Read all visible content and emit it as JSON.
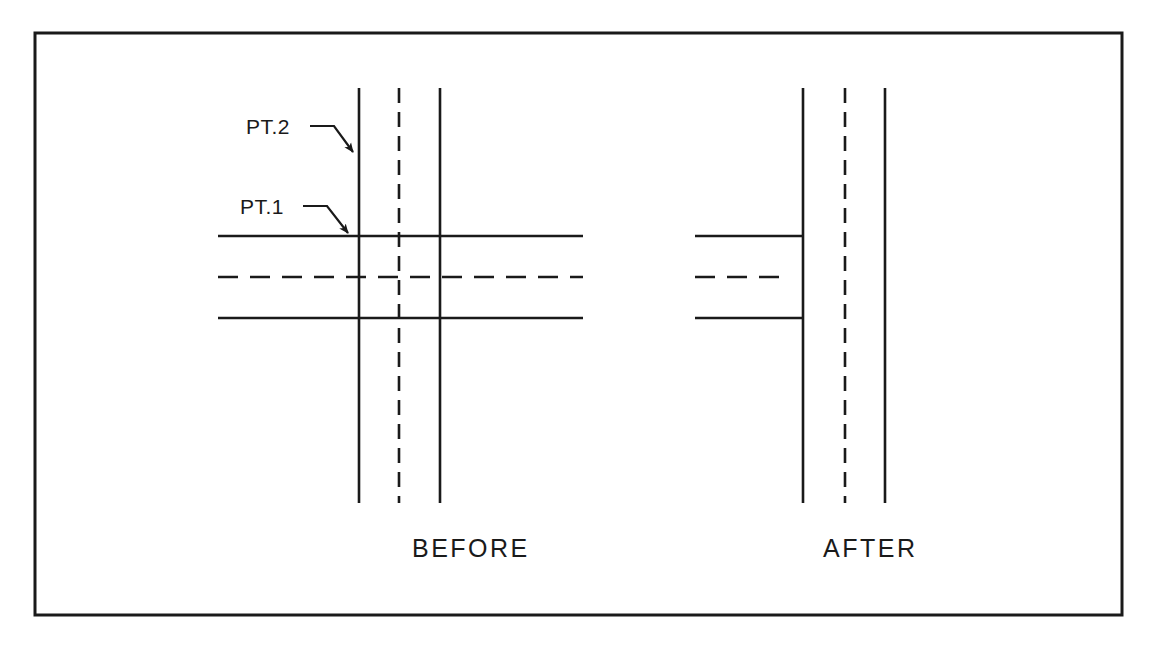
{
  "document": {
    "title": "BEFORE / AFTER trim comparison",
    "background_color": "#ffffff",
    "ink_color": "#1a1a1a",
    "border": {
      "name": "outer-frame",
      "x": 35,
      "y": 33,
      "width": 1087,
      "height": 582,
      "stroke_width": 3
    }
  },
  "annotations": {
    "pt1": {
      "text": "PT.1",
      "text_x": 240,
      "text_y": 214,
      "leader": "M 303 206 L 327 206 L 348 233",
      "arrow_tip_x": 351,
      "arrow_tip_y": 236
    },
    "pt2": {
      "text": "PT.2",
      "text_x": 246,
      "text_y": 134,
      "leader": "M 310 126 L 334 126 L 353 152",
      "arrow_tip_x": 357,
      "arrow_tip_y": 157
    }
  },
  "panels": [
    {
      "id": "before",
      "label": "BEFORE",
      "label_x": 412,
      "label_y": 557,
      "description": "Two crossing corridors drawn full length; no geometry trimmed at the intersection.",
      "vertical_lines": [
        {
          "name": "vertical-edge-left",
          "style": "solid",
          "x": 359,
          "y1": 88,
          "y2": 503
        },
        {
          "name": "vertical-centerline",
          "style": "dashed",
          "x": 399,
          "y1": 88,
          "y2": 503
        },
        {
          "name": "vertical-edge-right",
          "style": "solid",
          "x": 440,
          "y1": 88,
          "y2": 503
        }
      ],
      "horizontal_lines": [
        {
          "name": "horizontal-edge-top",
          "style": "solid",
          "y": 236,
          "x1": 218,
          "x2": 583
        },
        {
          "name": "horizontal-centerline",
          "style": "dashed",
          "y": 277,
          "x1": 218,
          "x2": 583
        },
        {
          "name": "horizontal-edge-bottom",
          "style": "solid",
          "y": 318,
          "x1": 218,
          "x2": 583
        }
      ]
    },
    {
      "id": "after",
      "label": "AFTER",
      "label_x": 823,
      "label_y": 557,
      "description": "Horizontal corridor trimmed back to the left vertical edge, forming a tee intersection.",
      "vertical_lines": [
        {
          "name": "vertical-edge-left",
          "style": "solid",
          "x": 803,
          "y1": 88,
          "y2": 503
        },
        {
          "name": "vertical-centerline",
          "style": "dashed",
          "x": 845,
          "y1": 88,
          "y2": 503
        },
        {
          "name": "vertical-edge-right",
          "style": "solid",
          "x": 885,
          "y1": 88,
          "y2": 503
        }
      ],
      "horizontal_lines": [
        {
          "name": "horizontal-edge-top",
          "style": "solid",
          "y": 236,
          "x1": 695,
          "x2": 803
        },
        {
          "name": "horizontal-centerline",
          "style": "dashed",
          "y": 277,
          "x1": 695,
          "x2": 790
        },
        {
          "name": "horizontal-edge-bottom",
          "style": "solid",
          "y": 318,
          "x1": 695,
          "x2": 803
        }
      ]
    }
  ],
  "line_styles": {
    "solid_stroke_width": 2.6,
    "dashed_stroke_width": 2.6,
    "dash_pattern_horizontal": "20 12",
    "dash_pattern_vertical": "15 9"
  }
}
